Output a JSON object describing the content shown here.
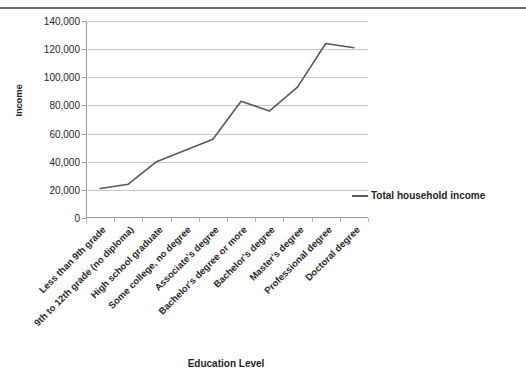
{
  "chart_data": {
    "type": "line",
    "title": "",
    "xlabel": "Education Level",
    "ylabel": "Income",
    "ylim": [
      0,
      140000
    ],
    "ytick_labels": [
      "140,000",
      "120,000",
      "100,000",
      "80,000",
      "60,000",
      "40,000",
      "20,000",
      "0"
    ],
    "ytick_values": [
      140000,
      120000,
      100000,
      80000,
      60000,
      40000,
      20000,
      0
    ],
    "grid": true,
    "legend_position": "right",
    "categories": [
      "Less than 9th grade",
      "9th to 12th grade (no diploma)",
      "High school graduate",
      "Some college, no degree",
      "Associate's degree",
      "Bachelor's degree or more",
      "Bachelor's degree",
      "Master's degree",
      "Professional degree",
      "Doctoral degree"
    ],
    "series": [
      {
        "name": "Total household income",
        "color": "#5a5a5a",
        "values": [
          21000,
          24000,
          40000,
          48000,
          56000,
          83000,
          76000,
          93000,
          124000,
          121000
        ]
      }
    ]
  },
  "legend": {
    "entries": [
      {
        "label": "Total household income"
      }
    ]
  },
  "axis": {
    "y_title": "Income",
    "x_title": "Education Level"
  },
  "header": {
    "partial_title": ""
  }
}
